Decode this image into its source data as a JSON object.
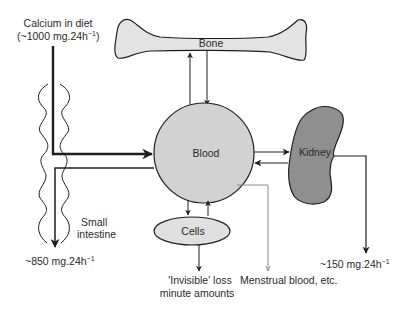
{
  "diagram": {
    "colors": {
      "bone_fill": "#e3e3e3",
      "blood_fill": "#d2d2d2",
      "kidney_fill": "#8f8f8f",
      "cells_fill": "#e0e0e0",
      "stroke": "#1e1e1e",
      "menstrual_line": "#8a8a8a"
    },
    "nodes": {
      "bone": {
        "label": "Bone"
      },
      "blood": {
        "label": "Blood"
      },
      "kidney": {
        "label": "Kidney"
      },
      "cells": {
        "label": "Cells"
      },
      "small_intestine": {
        "label_line1": "Small",
        "label_line2": "intestine"
      }
    },
    "inputs": {
      "diet": {
        "line1": "Calcium in diet",
        "line2_prefix": "(~1000 mg.24h",
        "line2_sup": "−1",
        "line2_suffix": ")"
      }
    },
    "outputs": {
      "faecal": {
        "prefix": "~850 mg.24h",
        "sup": "−1"
      },
      "urinary": {
        "prefix": "~150 mg.24h",
        "sup": "−1"
      },
      "invisible": {
        "line1": "'Invisible' loss",
        "line2": "minute amounts"
      },
      "menstrual": {
        "label": "Menstrual blood, etc."
      }
    },
    "edges": [
      {
        "from": "diet",
        "to": "blood",
        "via": "small_intestine"
      },
      {
        "from": "blood",
        "to": "faecal",
        "via": "small_intestine"
      },
      {
        "from": "blood",
        "to": "bone"
      },
      {
        "from": "bone",
        "to": "blood"
      },
      {
        "from": "blood",
        "to": "kidney"
      },
      {
        "from": "kidney",
        "to": "blood"
      },
      {
        "from": "kidney",
        "to": "urinary"
      },
      {
        "from": "blood",
        "to": "cells"
      },
      {
        "from": "cells",
        "to": "blood"
      },
      {
        "from": "cells",
        "to": "invisible"
      },
      {
        "from": "blood",
        "to": "menstrual"
      }
    ]
  }
}
